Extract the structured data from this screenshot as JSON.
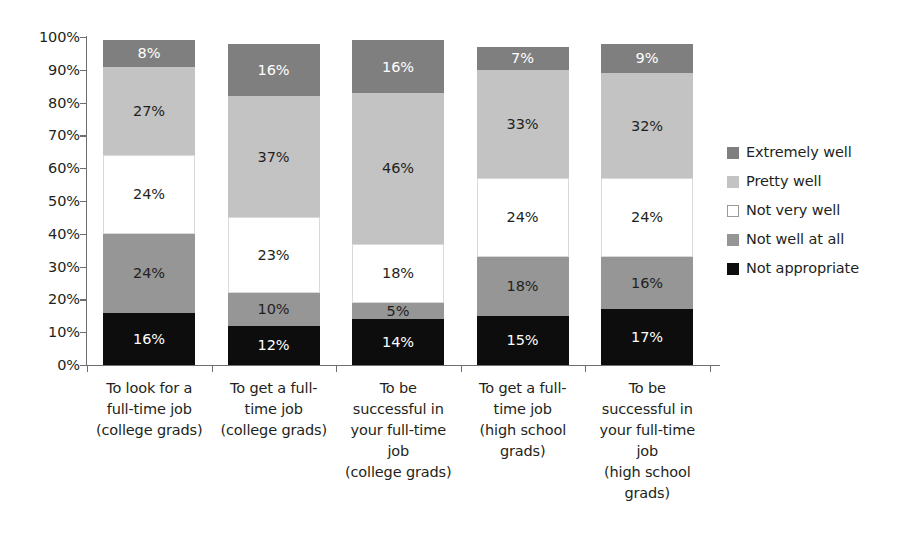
{
  "chart_data": {
    "type": "bar",
    "subtype": "stacked-100-percent",
    "title": "",
    "xlabel": "",
    "ylabel": "",
    "ylim": [
      0,
      100
    ],
    "grid": false,
    "legend_position": "right",
    "y_ticks": [
      "0%",
      "10%",
      "20%",
      "30%",
      "40%",
      "50%",
      "60%",
      "70%",
      "80%",
      "90%",
      "100%"
    ],
    "categories": [
      "To look for a full-time job (college grads)",
      "To get a full-time job (college grads)",
      "To be successful in your full-time job (college grads)",
      "To get a full-time job (high school grads)",
      "To be successful in your full-time job (high school grads)"
    ],
    "category_lines": [
      [
        "To look for a",
        "full-time job",
        "(college grads)"
      ],
      [
        "To get a full-",
        "time job",
        "(college grads)"
      ],
      [
        "To be",
        "successful in",
        "your full-time",
        "job",
        "(college grads)"
      ],
      [
        "To get a full-",
        "time job",
        "(high school",
        "grads)"
      ],
      [
        "To be",
        "successful in",
        "your full-time",
        "job",
        "(high school",
        "grads)"
      ]
    ],
    "series": [
      {
        "name": "Not appropriate",
        "color": "#0d0d0d",
        "text_color": "#ffffff",
        "values": [
          16,
          12,
          14,
          15,
          17
        ]
      },
      {
        "name": "Not well at all",
        "color": "#969696",
        "text_color": "#231f20",
        "values": [
          24,
          10,
          5,
          18,
          16
        ]
      },
      {
        "name": "Not very well",
        "color": "#ffffff",
        "text_color": "#231f20",
        "values": [
          24,
          23,
          18,
          24,
          24
        ]
      },
      {
        "name": "Pretty well",
        "color": "#c3c3c3",
        "text_color": "#231f20",
        "values": [
          27,
          37,
          46,
          33,
          32
        ]
      },
      {
        "name": "Extremely well",
        "color": "#7f7f7f",
        "text_color": "#ffffff",
        "values": [
          8,
          16,
          16,
          7,
          9
        ]
      }
    ],
    "legend_entries": [
      {
        "label": "Extremely well",
        "color": "#7f7f7f"
      },
      {
        "label": "Pretty well",
        "color": "#c3c3c3"
      },
      {
        "label": "Not very well",
        "color": "#ffffff"
      },
      {
        "label": "Not well at all",
        "color": "#969696"
      },
      {
        "label": "Not appropriate",
        "color": "#0d0d0d"
      }
    ],
    "value_labels": [
      [
        "8%",
        "27%",
        "24%",
        "24%",
        "16%"
      ],
      [
        "16%",
        "37%",
        "23%",
        "10%",
        "12%"
      ],
      [
        "16%",
        "46%",
        "18%",
        "5%",
        "14%"
      ],
      [
        "7%",
        "33%",
        "24%",
        "18%",
        "15%"
      ],
      [
        "9%",
        "32%",
        "24%",
        "16%",
        "17%"
      ]
    ],
    "axis_color": "#6d6e71"
  }
}
